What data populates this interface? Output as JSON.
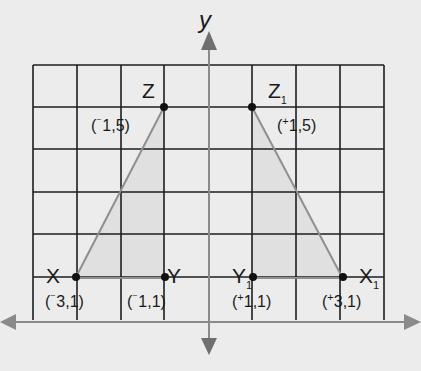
{
  "diagram": {
    "type": "coordinate-grid-reflection",
    "axis_label_y": "y",
    "grid": {
      "columns": 8,
      "rows": 6,
      "x_range": [
        -4,
        4
      ],
      "y_range": [
        0,
        6
      ]
    },
    "colors": {
      "background": "#ececec",
      "grid_line": "#1e1e1e",
      "axis": "#8a8a8a",
      "triangle_fill": "#e0e0e0",
      "triangle_edge": "#8f8f8f",
      "point": "#111111"
    },
    "triangles": [
      {
        "name": "original",
        "points": [
          {
            "label": "X",
            "subscript": "",
            "coord_sign": "⁻",
            "coord_text": "3,1",
            "x": -3,
            "y": 1
          },
          {
            "label": "Y",
            "subscript": "",
            "coord_sign": "⁻",
            "coord_text": "1,1",
            "x": -1,
            "y": 1
          },
          {
            "label": "Z",
            "subscript": "",
            "coord_sign": "⁻",
            "coord_text": "1,5",
            "x": -1,
            "y": 5
          }
        ]
      },
      {
        "name": "reflection",
        "points": [
          {
            "label": "X",
            "subscript": "1",
            "coord_sign": "+",
            "coord_text": "3,1",
            "x": 3,
            "y": 1
          },
          {
            "label": "Y",
            "subscript": "1",
            "coord_sign": "+",
            "coord_text": "1,1",
            "x": 1,
            "y": 1
          },
          {
            "label": "Z",
            "subscript": "1",
            "coord_sign": "+",
            "coord_text": "1,5",
            "x": 1,
            "y": 5
          }
        ]
      }
    ]
  },
  "labels": {
    "X": "X",
    "Y": "Y",
    "Z": "Z",
    "X1": "X",
    "Y1": "Y",
    "Z1": "Z",
    "sub1": "1",
    "coord_X": "3,1)",
    "coord_Y": "1,1)",
    "coord_Z": "1,5)",
    "coord_X1": "3,1)",
    "coord_Y1": "1,1)",
    "coord_Z1": "1,5)",
    "open": "(",
    "neg": "⁻",
    "pos": "+"
  }
}
